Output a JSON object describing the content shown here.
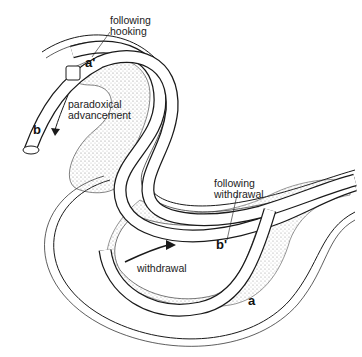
{
  "figure": {
    "labels": {
      "following_hooking": [
        "following",
        "hooking"
      ],
      "paradoxical_advancement": [
        "paradoxical",
        "advancement"
      ],
      "following_withdrawal": [
        "following",
        "withdrawal"
      ],
      "withdrawal": "withdrawal"
    },
    "position_letters": {
      "a_prime": "a'",
      "b": "b",
      "b_prime": "b'",
      "a": "a"
    },
    "colors": {
      "line": "#1a1a1a",
      "stipple": "#9a9a9a",
      "background": "#ffffff"
    }
  }
}
